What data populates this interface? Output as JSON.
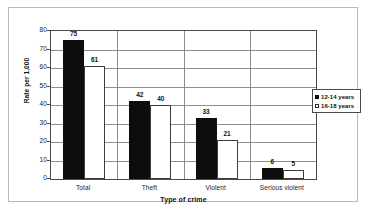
{
  "chart_data": {
    "type": "bar",
    "title": "",
    "subtitle": "",
    "xlabel": "Type of crime",
    "ylabel": "Rate per 1,000",
    "categories": [
      "Total",
      "Theft",
      "Violent",
      "Serious violent"
    ],
    "series": [
      {
        "name": "12-14 years",
        "values": [
          75,
          42,
          33,
          6
        ],
        "fill": "#0d0d0d",
        "style": "filled"
      },
      {
        "name": "16-18 years",
        "values": [
          61,
          40,
          21,
          5
        ],
        "fill": "#ffffff",
        "style": "outlined"
      }
    ],
    "ylim": [
      0,
      80
    ],
    "yticks": [
      0,
      10,
      20,
      30,
      40,
      50,
      60,
      70,
      80
    ],
    "ytick_labels": [
      "0",
      "10",
      "20",
      "30",
      "40",
      "50",
      "60",
      "70",
      "80"
    ],
    "grid": "horizontal",
    "legend_position": "right-outside",
    "data_labels": true
  },
  "legend": {
    "entries": [
      {
        "label": "12-14 years"
      },
      {
        "label": "16-18 years"
      }
    ]
  }
}
